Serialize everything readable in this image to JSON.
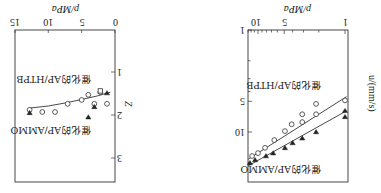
{
  "chart_data": [
    {
      "type": "scatter",
      "panel": "left-in-unrotated / burning-rate",
      "title": "",
      "xlabel": "p/MPa",
      "ylabel": "u/(mm/s)",
      "xscale": "log",
      "yscale": "log",
      "xlim": [
        0.96,
        13
      ],
      "ylim": [
        1,
        30
      ],
      "xticks": [
        1,
        5,
        10
      ],
      "xtick_labels": [
        "1",
        "5",
        "10"
      ],
      "yticks": [
        1,
        5,
        10
      ],
      "ytick_labels": [
        "1",
        "5",
        "10"
      ],
      "grid": false,
      "orientation": "figure rotated 180 degrees",
      "series": [
        {
          "name": "催化的AP/HTPB",
          "marker": "open-circle",
          "points": [
            [
              1.0,
              4.9
            ],
            [
              2.15,
              5.3
            ],
            [
              2.15,
              6.7
            ],
            [
              3.1,
              6.7
            ],
            [
              3.1,
              8.0
            ],
            [
              4.1,
              8.4
            ],
            [
              4.9,
              9.8
            ],
            [
              6.5,
              12.0
            ],
            [
              8.3,
              14.3
            ],
            [
              10.0,
              16.1
            ],
            [
              11.7,
              17.2
            ]
          ],
          "fit_line": [
            [
              0.96,
              4.5
            ],
            [
              13,
              18.5
            ]
          ]
        },
        {
          "name": "催化的AP/AMMO",
          "marker": "filled-triangle-down",
          "points": [
            [
              1.0,
              6.2
            ],
            [
              1.0,
              7.1
            ],
            [
              2.15,
              10.0
            ],
            [
              3.1,
              11.5
            ],
            [
              4.0,
              12.8
            ],
            [
              4.9,
              14.3
            ],
            [
              6.7,
              16.1
            ],
            [
              8.1,
              17.2
            ],
            [
              10.8,
              18.8
            ],
            [
              12.4,
              20.1
            ]
          ],
          "fit_line": [
            [
              0.96,
              6.2
            ],
            [
              13,
              21.5
            ]
          ]
        }
      ]
    },
    {
      "type": "scatter",
      "panel": "right-in-unrotated / Z",
      "title": "",
      "xlabel": "p/MPa",
      "ylabel": "Z",
      "xscale": "linear",
      "yscale": "linear",
      "xlim": [
        0,
        15
      ],
      "ylim": [
        0.05,
        3.5
      ],
      "xticks": [
        0,
        5,
        10,
        15
      ],
      "xtick_labels": [
        "0",
        "5",
        "10",
        "15"
      ],
      "yticks": [
        1,
        2,
        3
      ],
      "ytick_labels": [
        "1",
        "2",
        "3"
      ],
      "grid": false,
      "orientation": "figure rotated 180 degrees",
      "series": [
        {
          "name": "催化的AP/HTPB",
          "marker": "open-circle",
          "points": [
            [
              1.2,
              1.74
            ],
            [
              2.2,
              1.47
            ],
            [
              3.1,
              1.74
            ],
            [
              4.0,
              1.53
            ],
            [
              5.0,
              1.65
            ],
            [
              7.1,
              1.74
            ],
            [
              9.0,
              1.93
            ],
            [
              10.9,
              1.93
            ],
            [
              12.8,
              1.88
            ]
          ],
          "fit_curve": [
            [
              0.7,
              1.47
            ],
            [
              2.5,
              1.55
            ],
            [
              5.0,
              1.64
            ],
            [
              7.5,
              1.72
            ],
            [
              10.0,
              1.79
            ],
            [
              12.8,
              1.84
            ]
          ]
        },
        {
          "name": "催化的AP/AMMO",
          "marker": "filled-triangle-down",
          "points": [
            [
              1.2,
              1.49
            ],
            [
              3.1,
              1.81
            ],
            [
              4.0,
              2.05
            ],
            [
              12.8,
              1.95
            ]
          ]
        },
        {
          "name": "extra",
          "marker": "open-square",
          "points": [
            [
              2.2,
              1.44
            ]
          ]
        }
      ]
    }
  ],
  "labels": {
    "left_panel": {
      "xlabel": "p/MPa",
      "ylabel": "u/(mm/s)",
      "series_top": "催化的AP/AMMO",
      "series_bottom": "催化的AP/HTPB"
    },
    "right_panel": {
      "xlabel": "p/MPa",
      "ylabel": "Z",
      "series_top": "催化的AP/AMMO",
      "series_bottom": "催化的AP/HTPB"
    }
  },
  "colors": {
    "ink": "#222222",
    "background": "#ffffff"
  }
}
